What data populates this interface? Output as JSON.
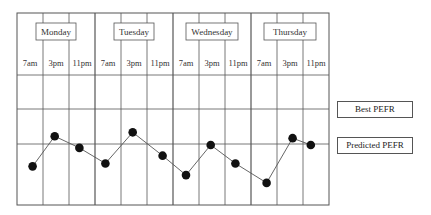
{
  "chart_data": {
    "type": "line",
    "title": "",
    "xlabel": "",
    "ylabel": "",
    "days": [
      "Monday",
      "Tuesday",
      "Wednesday",
      "Thursday"
    ],
    "categories": [
      "7am",
      "3pm",
      "11pm",
      "7am",
      "3pm",
      "11pm",
      "7am",
      "3pm",
      "11pm",
      "7am",
      "3pm",
      "11pm"
    ],
    "series": [
      {
        "name": "PEFR readings",
        "values": [
          41,
          72,
          60,
          44,
          76,
          52,
          32,
          63,
          44,
          24,
          70,
          63
        ]
      }
    ],
    "reference_lines": [
      {
        "name": "Best PEFR",
        "value": 100
      },
      {
        "name": "Predicted PEFR",
        "value": 64
      }
    ],
    "ylim": [
      -40,
      134
    ],
    "grid": true,
    "legend_position": "right"
  },
  "legend": {
    "best_label": "Best PEFR",
    "predicted_label": "Predicted PEFR"
  }
}
